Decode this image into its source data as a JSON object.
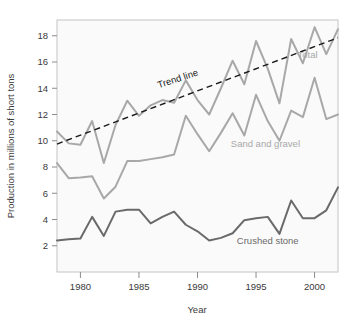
{
  "chart_data": {
    "type": "line",
    "title": "",
    "xlabel": "Year",
    "ylabel": "Production in millions of short tons",
    "xlim": [
      1978,
      2002
    ],
    "ylim": [
      0,
      19.2
    ],
    "grid": false,
    "legend_position": "inline-labels",
    "xticks": [
      1980,
      1985,
      1990,
      1995,
      2000
    ],
    "xtick_labels": [
      "1980",
      "1985",
      "1990",
      "1995",
      "2000"
    ],
    "yticks": [
      2,
      4,
      6,
      8,
      10,
      12,
      14,
      16,
      18
    ],
    "ytick_labels": [
      "2",
      "4",
      "6",
      "8",
      "10",
      "12",
      "14",
      "16",
      "18"
    ],
    "x": [
      1978,
      1979,
      1980,
      1981,
      1982,
      1983,
      1984,
      1985,
      1986,
      1987,
      1988,
      1989,
      1990,
      1991,
      1992,
      1993,
      1994,
      1995,
      1996,
      1997,
      1998,
      1999,
      2000,
      2001,
      2002
    ],
    "series": [
      {
        "name": "Total",
        "color": "#a8a8a8",
        "label": "Total",
        "values": [
          10.7,
          9.8,
          9.7,
          11.5,
          8.3,
          11.2,
          13.05,
          11.9,
          12.7,
          13.1,
          12.9,
          14.6,
          13.1,
          12.0,
          14.0,
          16.1,
          14.3,
          17.6,
          15.5,
          12.85,
          17.75,
          15.9,
          18.65,
          16.6,
          18.5
        ]
      },
      {
        "name": "Sand and gravel",
        "color": "#a8a8a8",
        "label": "Sand and gravel",
        "values": [
          8.3,
          7.15,
          7.2,
          7.3,
          5.6,
          6.5,
          8.45,
          8.45,
          8.6,
          8.75,
          8.95,
          11.9,
          10.5,
          9.2,
          10.6,
          12.1,
          10.4,
          13.5,
          11.5,
          10.0,
          12.3,
          11.8,
          14.8,
          11.65,
          12.0
        ]
      },
      {
        "name": "Crushed stone",
        "color": "#6a6a6a",
        "label": "Crushed stone",
        "values": [
          2.4,
          2.5,
          2.55,
          4.2,
          2.75,
          4.6,
          4.75,
          4.75,
          3.7,
          4.2,
          4.6,
          3.6,
          3.1,
          2.4,
          2.6,
          2.95,
          3.95,
          4.1,
          4.2,
          2.9,
          5.45,
          4.1,
          4.1,
          4.7,
          6.45
        ]
      }
    ],
    "trend_line": {
      "name": "Trend line",
      "label": "Trend line",
      "color": "#1a1a1a",
      "style": "dashed",
      "x_start": 1978,
      "x_end": 2002,
      "y_start": 9.75,
      "y_end": 17.85
    },
    "annotations": [
      {
        "text": "Trend line",
        "x": 1988.4,
        "y": 14.5,
        "rotation": -18,
        "color": "#1a1a1a"
      },
      {
        "text": "Total",
        "x": 1999.4,
        "y": 16.3,
        "rotation": 0,
        "color": "#a8a8a8"
      },
      {
        "text": "Sand and gravel",
        "x": 1995.8,
        "y": 9.5,
        "rotation": 0,
        "color": "#a8a8a8"
      },
      {
        "text": "Crushed stone",
        "x": 1996.0,
        "y": 2.1,
        "rotation": 0,
        "color": "#6a6a6a"
      }
    ]
  },
  "style": {
    "plot_background": "#fafafa",
    "plot_border": "#c4c4c4",
    "axis_text": "#3a3a3a",
    "page_background": "#ffffff"
  }
}
